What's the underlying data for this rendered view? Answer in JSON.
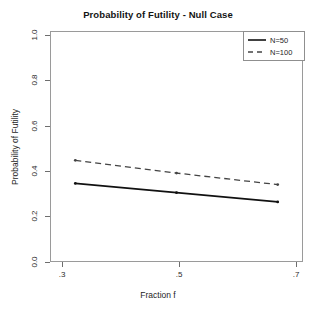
{
  "chart_data": {
    "type": "line",
    "title": "Probability of Futility - Null Case",
    "xlabel": "Fraction f",
    "ylabel": "Probability of Futility",
    "x": [
      0.3,
      0.5,
      0.7
    ],
    "xtick_labels": [
      ".3",
      ".5",
      ".7"
    ],
    "ytick_labels": [
      "0.0",
      "0.2",
      "0.4",
      "0.6",
      "0.8",
      "1.0"
    ],
    "ytick_values": [
      0.0,
      0.2,
      0.4,
      0.6,
      0.8,
      1.0
    ],
    "xlim": [
      0.25,
      0.75
    ],
    "ylim": [
      0.0,
      1.0
    ],
    "grid": false,
    "legend_position": "top-right",
    "series": [
      {
        "name": "N=50",
        "values": [
          0.34,
          0.3,
          0.26
        ],
        "style": "solid",
        "color": "#111111",
        "marker": "point"
      },
      {
        "name": "N=100",
        "values": [
          0.44,
          0.385,
          0.335
        ],
        "style": "dashed",
        "color": "#444444",
        "marker": "point"
      }
    ]
  },
  "legend": {
    "items": [
      {
        "label": "N=50"
      },
      {
        "label": "N=100"
      }
    ]
  }
}
